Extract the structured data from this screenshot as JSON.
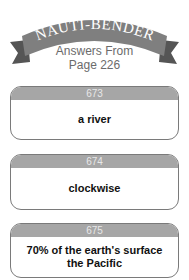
{
  "banner": {
    "title": "NAUTI-BENDER",
    "subtitle_line1": "Answers From",
    "subtitle_line2": "Page 226"
  },
  "colors": {
    "banner": "#7f7f7f",
    "card_header": "#a6a6a6",
    "card_border": "#7a7a7a"
  },
  "cards": [
    {
      "number": "673",
      "answer_line1": "a river",
      "answer_line2": ""
    },
    {
      "number": "674",
      "answer_line1": "clockwise",
      "answer_line2": ""
    },
    {
      "number": "675",
      "answer_line1": "70% of the earth's surface",
      "answer_line2": "the Pacific"
    }
  ]
}
